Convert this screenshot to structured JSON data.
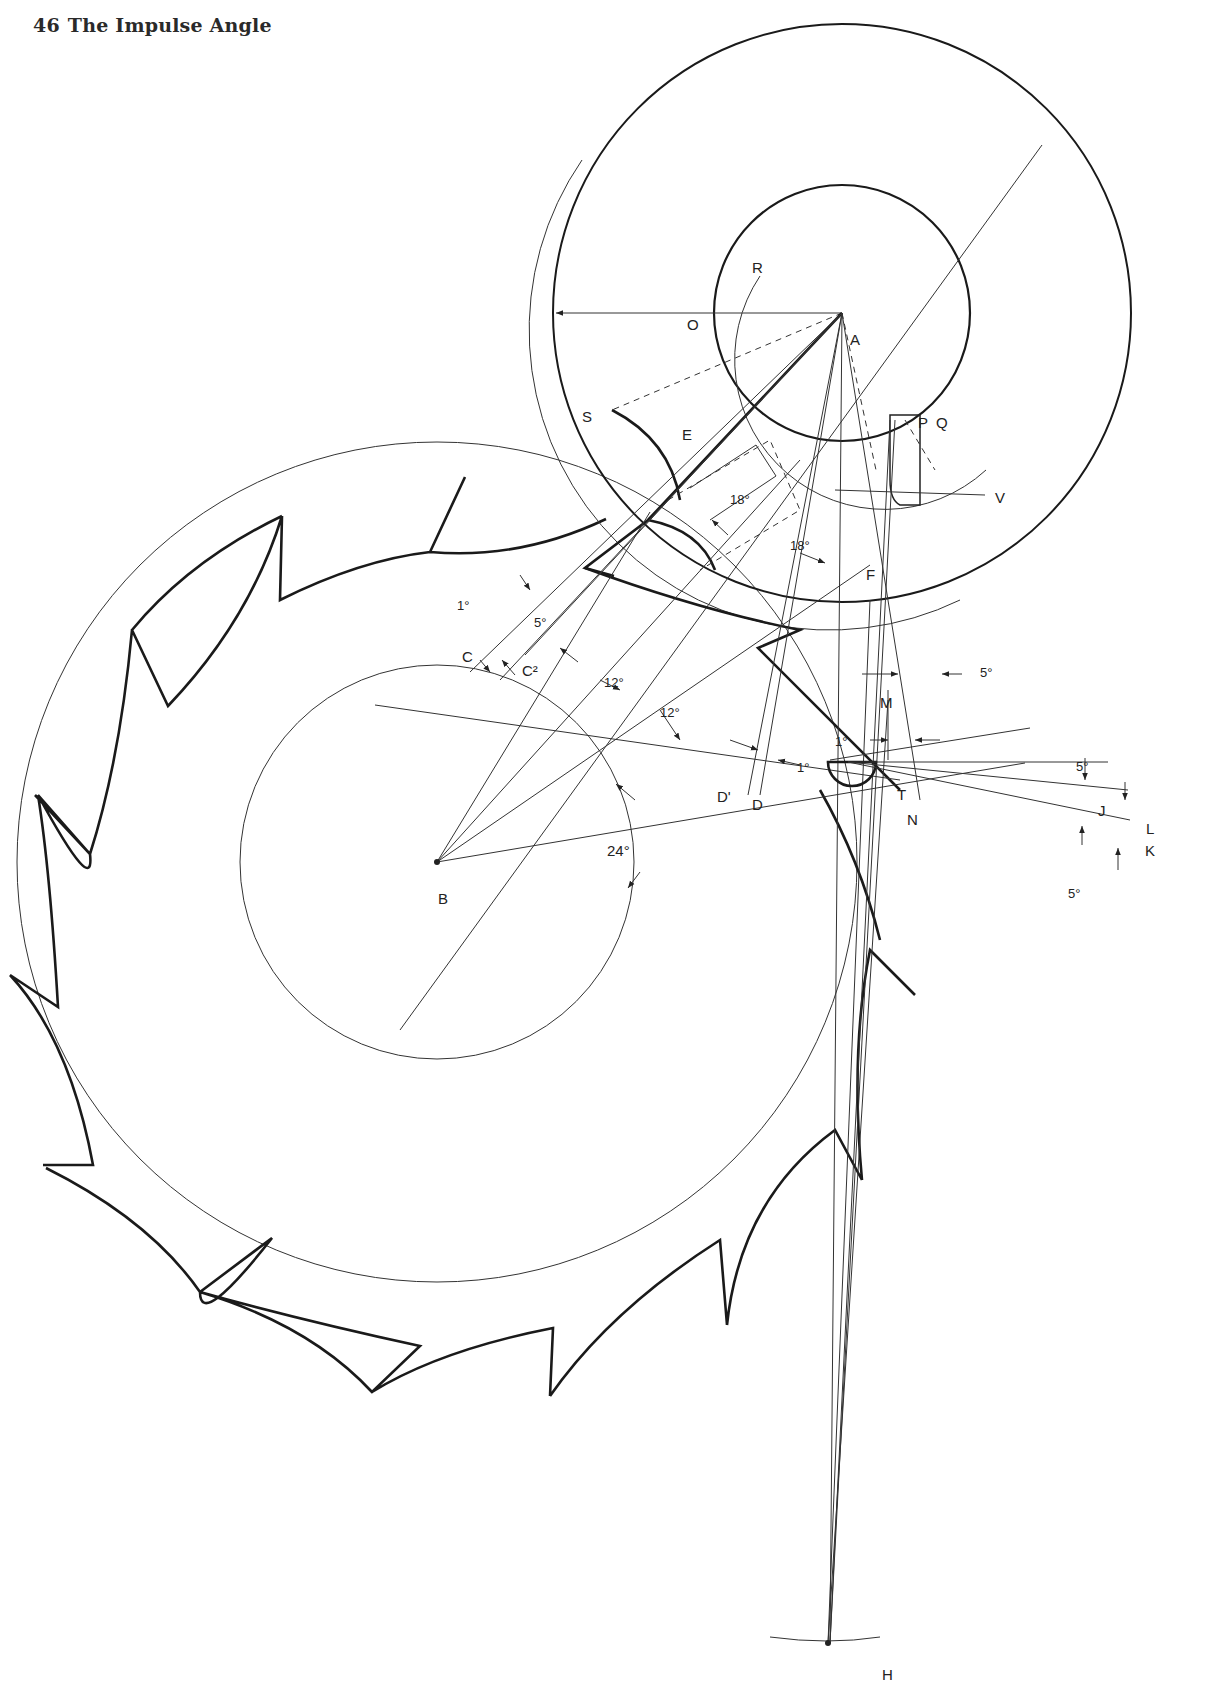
{
  "header": {
    "page_number": "46",
    "title": "The Impulse Angle"
  },
  "figure": {
    "points": {
      "A": "A",
      "B": "B",
      "C": "C",
      "C2": "C²",
      "D": "D",
      "D1": "D'",
      "E": "E",
      "F": "F",
      "H": "H",
      "J": "J",
      "K": "K",
      "L": "L",
      "M": "M",
      "N": "N",
      "O": "O",
      "P": "P",
      "Q": "Q",
      "R": "R",
      "S": "S",
      "T": "T",
      "V": "V"
    },
    "angles": {
      "a1_C": "1°",
      "a5_C": "5°",
      "a12_first": "12°",
      "a12_second": "12°",
      "a18_first": "18°",
      "a18_second": "18°",
      "a1_D": "1°",
      "a1_M": "1°",
      "a5_top": "5°",
      "a5_J": "5°",
      "a5_K": "5°",
      "a24": "24°"
    }
  }
}
